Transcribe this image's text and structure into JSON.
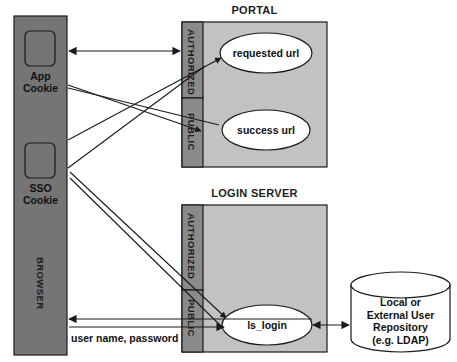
{
  "diagram": {
    "title_portal": "PORTAL",
    "title_login_server": "LOGIN SERVER",
    "browser": {
      "label": "BROWSER",
      "cookies": [
        {
          "label": "App\nCookie"
        },
        {
          "label": "SSO\nCookie"
        }
      ]
    },
    "zones": {
      "authorized": "AUTHORIZED",
      "public": "PUBLIC"
    },
    "portal": {
      "zone_authorized": "AUTHORIZED",
      "zone_public": "PUBLIC",
      "nodes": [
        {
          "label": "requested url"
        },
        {
          "label": "success url"
        }
      ]
    },
    "login_server": {
      "zone_authorized": "AUTHORIZED",
      "zone_public": "PUBLIC",
      "nodes": [
        {
          "label": "ls_login"
        }
      ]
    },
    "repository": {
      "label": "Local or\nExternal User\nRepository\n(e.g. LDAP)"
    },
    "edges": [
      {
        "label": "user name, password"
      }
    ],
    "colors": {
      "browser_fill": "#757575",
      "zone_fill": "#8a8a8a",
      "box_fill": "#c2c2c2",
      "node_fill": "#ffffff",
      "stroke": "#1a1a1a"
    }
  }
}
